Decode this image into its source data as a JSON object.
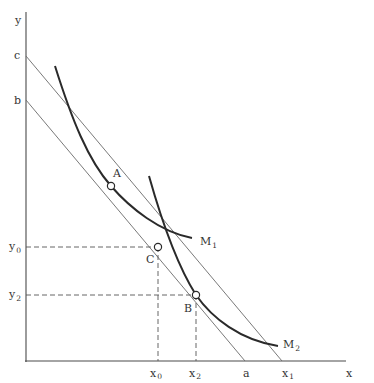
{
  "diagram": {
    "type": "economics-indifference-budget-diagram",
    "axes": {
      "x_label": "x",
      "y_label": "y"
    },
    "y_intercepts": {
      "c": "c",
      "b": "b"
    },
    "x_intercepts": {
      "a": "a",
      "x1": "x",
      "x1_sub": "1"
    },
    "curves": [
      {
        "id": "M1",
        "label": "M",
        "sub": "1"
      },
      {
        "id": "M2",
        "label": "M",
        "sub": "2"
      }
    ],
    "points": [
      {
        "id": "A",
        "label": "A"
      },
      {
        "id": "B",
        "label": "B"
      },
      {
        "id": "C",
        "label": "C"
      }
    ],
    "guides": {
      "y0": {
        "label": "y",
        "sub": "0"
      },
      "y2": {
        "label": "y",
        "sub": "2"
      },
      "x0": {
        "label": "x",
        "sub": "0"
      },
      "x2": {
        "label": "x",
        "sub": "2"
      }
    },
    "lines": [
      {
        "id": "budget-c-x1",
        "from": "c",
        "to": "x1"
      },
      {
        "id": "budget-b-a",
        "from": "b",
        "to": "a"
      }
    ],
    "colors": {
      "axis": "#4a4a4a",
      "budget_line": "#6a6a6a",
      "curve": "#2a2a2a",
      "guide": "#555555",
      "text": "#333333"
    }
  }
}
